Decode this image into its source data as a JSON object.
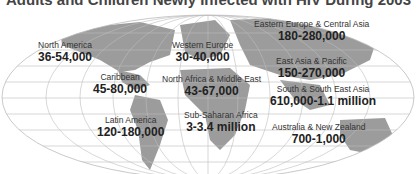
{
  "title": "Adults and Children Newly Infected with HIV During 2003",
  "colors": {
    "land": "#9a9a9a",
    "grid": "#b8b8b8",
    "text": "#222222"
  },
  "regions": [
    {
      "name": "North America",
      "value": "36-54,000"
    },
    {
      "name": "Caribbean",
      "value": "45-80,000"
    },
    {
      "name": "Latin America",
      "value": "120-180,000"
    },
    {
      "name": "Western Europe",
      "value": "30-40,000"
    },
    {
      "name": "North Africa & Middle East",
      "value": "43-67,000"
    },
    {
      "name": "Sub-Saharan Africa",
      "value": "3-3.4 million"
    },
    {
      "name": "Eastern Europe & Central Asia",
      "value": "180-280,000"
    },
    {
      "name": "East Asia & Pacific",
      "value": "150-270,000"
    },
    {
      "name": "South & South East Asia",
      "value": "610,000-1.1 million"
    },
    {
      "name": "Australia & New Zealand",
      "value": "700-1,000"
    }
  ]
}
